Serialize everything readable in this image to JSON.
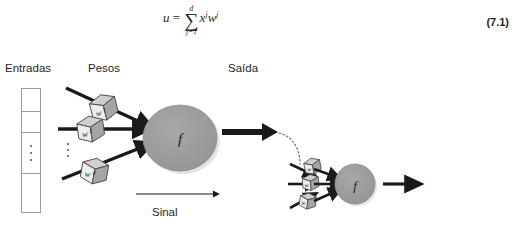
{
  "equation": {
    "lhs": "u",
    "equals": "=",
    "sum_upper": "d",
    "sum_symbol": "∑",
    "sum_lower": "j=1",
    "term_x": "x",
    "term_x_sup": "j",
    "term_w": "w",
    "term_w_sup": "j",
    "number": "(7.1)",
    "plain": "u = ∑(j=1..d) x^j w^j"
  },
  "diagram": {
    "labels": {
      "inputs": "Entradas",
      "weights": "Pesos",
      "output": "Saída",
      "signal": "Sinal"
    },
    "input_vector": {
      "cells": [
        "",
        "",
        "⋮",
        "",
        ""
      ],
      "ellipsis_glyph": "⋮"
    },
    "weight_cubes": [
      {
        "label": "w",
        "superscript": "1"
      },
      {
        "label": "w",
        "superscript": "2"
      },
      {
        "label": "w",
        "superscript": "d"
      }
    ],
    "weights_ellipsis": "⋮",
    "neuron": {
      "activation_label": "f"
    },
    "detail_neuron": {
      "activation_label": "f",
      "cubes": [
        {
          "label": "w"
        },
        {
          "label": "w"
        },
        {
          "label": "w"
        }
      ]
    }
  },
  "colors": {
    "neuron_fill": "#9a9a9a",
    "neuron_stroke": "#8c8c8c",
    "cube_front": "#e8e8e8",
    "cube_top": "#cfcfcf",
    "cube_side": "#a8a8a8",
    "cube_stroke": "#4a4a4a",
    "arrow_dark": "#1a1a1a",
    "box_stroke": "#9a9a9a",
    "text": "#231f20",
    "shadow": "#d9d9d9"
  }
}
